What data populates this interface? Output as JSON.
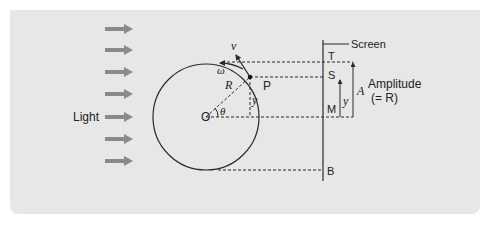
{
  "diagram": {
    "colors": {
      "background": "#e7e7e7",
      "arrow": "#8a8a8a",
      "line": "#2a2a2a",
      "text": "#222222"
    },
    "light": {
      "label": "Light",
      "arrow_count": 7
    },
    "circle": {
      "center_label": "O",
      "radius_label": "R",
      "angle_label": "θ",
      "point_label": "P",
      "velocity_label": "v",
      "angular_velocity_label": "ω",
      "displacement_label": "y"
    },
    "screen": {
      "label": "Screen",
      "points": {
        "top": "T",
        "shadow": "S",
        "middle": "M",
        "bottom": "B"
      },
      "displacement_label": "y",
      "amplitude_symbol": "A",
      "amplitude_label": "Amplitude",
      "amplitude_note": "(= R)"
    }
  }
}
